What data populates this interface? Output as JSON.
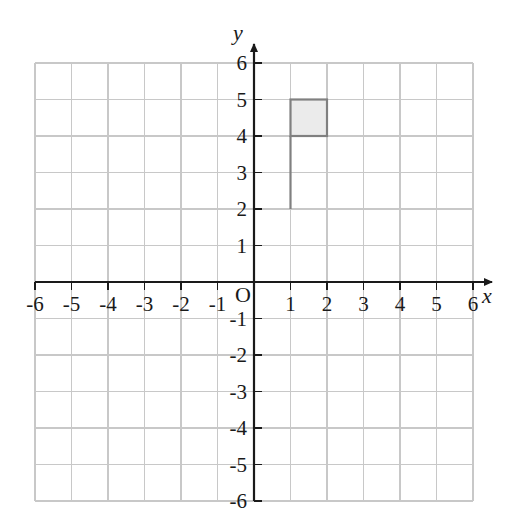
{
  "chart_data": {
    "type": "scatter",
    "title": "",
    "xlabel": "x",
    "ylabel": "y",
    "xlim": [
      -6,
      6
    ],
    "ylim": [
      -6,
      6
    ],
    "grid": true,
    "grid_step": 1,
    "legend": "none",
    "x_ticks": [
      -6,
      -5,
      -4,
      -3,
      -2,
      -1,
      1,
      2,
      3,
      4,
      5,
      6
    ],
    "y_ticks": [
      6,
      5,
      4,
      3,
      2,
      1,
      -1,
      -2,
      -3,
      -4,
      -5,
      -6
    ],
    "x_tick_labels": [
      "-6",
      "-5",
      "-4",
      "-3",
      "-2",
      "-1",
      "1",
      "2",
      "3",
      "4",
      "5",
      "6"
    ],
    "y_tick_labels": [
      "6",
      "5",
      "4",
      "3",
      "2",
      "1",
      "-1",
      "-2",
      "-3",
      "-4",
      "-5",
      "-6"
    ],
    "origin_label": "O",
    "shapes": [
      {
        "name": "shaded-square",
        "type": "rectangle",
        "x_min": 1,
        "x_max": 2,
        "y_min": 4,
        "y_max": 5,
        "fill": "#ebebeb",
        "stroke": "#808080"
      },
      {
        "name": "vertical-segment",
        "type": "segment",
        "x": 1,
        "y_start": 2,
        "y_end": 4,
        "stroke": "#808080"
      }
    ],
    "annotations": []
  },
  "style": {
    "background": "#ffffff",
    "grid_color": "#c8c8c8",
    "axis_color": "#1a1a1a",
    "shape_fill": "#ebebeb",
    "shape_stroke": "#808080"
  }
}
